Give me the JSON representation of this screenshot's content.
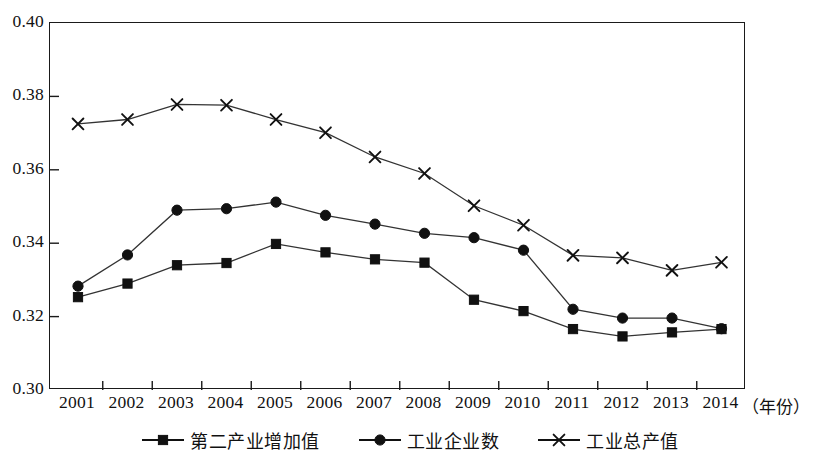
{
  "chart_data": {
    "type": "line",
    "title": "",
    "subtitle": "",
    "xlabel": "（年份）",
    "ylabel": "",
    "grid": false,
    "legend_position": "bottom-center",
    "xlim_categories": [
      "2001",
      "2002",
      "2003",
      "2004",
      "2005",
      "2006",
      "2007",
      "2008",
      "2009",
      "2010",
      "2011",
      "2012",
      "2013",
      "2014"
    ],
    "ylim": [
      0.3,
      0.4
    ],
    "y_ticks": [
      "0.40",
      "0.38",
      "0.36",
      "0.34",
      "0.32",
      "0.30"
    ],
    "y_tick_values": [
      0.4,
      0.38,
      0.36,
      0.34,
      0.32,
      0.3
    ],
    "categories": [
      "2001",
      "2002",
      "2003",
      "2004",
      "2005",
      "2006",
      "2007",
      "2008",
      "2009",
      "2010",
      "2011",
      "2012",
      "2013",
      "2014"
    ],
    "series": [
      {
        "name": "第二产业增加值",
        "marker": "square",
        "color": "#111111",
        "values": [
          0.3253,
          0.329,
          0.334,
          0.3346,
          0.3398,
          0.3375,
          0.3356,
          0.3347,
          0.3246,
          0.3215,
          0.3166,
          0.3146,
          0.3157,
          0.3166
        ]
      },
      {
        "name": "工业企业数",
        "marker": "circle",
        "color": "#111111",
        "values": [
          0.3283,
          0.3368,
          0.349,
          0.3494,
          0.3512,
          0.3476,
          0.3452,
          0.3427,
          0.3415,
          0.3381,
          0.322,
          0.3196,
          0.3196,
          0.3167
        ]
      },
      {
        "name": "工业总产值",
        "marker": "x",
        "color": "#111111",
        "values": [
          0.3725,
          0.3737,
          0.3778,
          0.3776,
          0.3737,
          0.3701,
          0.3635,
          0.359,
          0.3502,
          0.3449,
          0.3367,
          0.336,
          0.3326,
          0.3348
        ]
      }
    ]
  },
  "legend": {
    "items": [
      {
        "label": "第二产业增加值",
        "marker": "square"
      },
      {
        "label": "工业企业数",
        "marker": "circle"
      },
      {
        "label": "工业总产值",
        "marker": "x"
      }
    ]
  },
  "axis": {
    "x_unit_label": "（年份）"
  },
  "colors": {
    "line": "#1a1a1a",
    "frame": "#1a1a1a",
    "text": "#111111",
    "background": "#ffffff"
  }
}
